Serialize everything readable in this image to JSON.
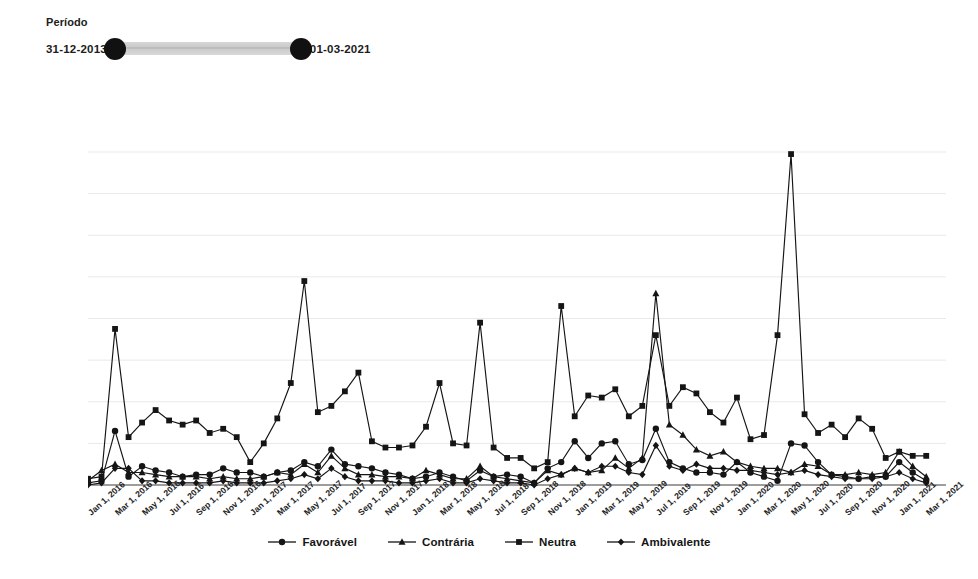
{
  "filter": {
    "title": "Período",
    "start_date": "31-12-2013",
    "end_date": "01-03-2021"
  },
  "legend": {
    "position": "bottom-center",
    "items": [
      {
        "label": "Favorável",
        "marker": "circle"
      },
      {
        "label": "Contrária",
        "marker": "triangle"
      },
      {
        "label": "Neutra",
        "marker": "square"
      },
      {
        "label": "Ambivalente",
        "marker": "diamond"
      }
    ]
  },
  "colors": {
    "series": "#151515",
    "grid": "#e9e9e9",
    "axis": "#7d7d7d",
    "slider_track": "#d6d6d6",
    "slider_handle": "#111111",
    "text": "#1a1a1a"
  },
  "chart_data": {
    "type": "line",
    "title": "",
    "subtitle": "",
    "xlabel": "",
    "ylabel": "",
    "grid": true,
    "legend_position": "bottom",
    "ylim": [
      0,
      160
    ],
    "yticks": [
      0,
      20,
      40,
      60,
      80,
      100,
      120,
      140,
      160
    ],
    "x": [
      "Jan 1, 2016",
      "Feb 1, 2016",
      "Mar 1, 2016",
      "Apr 1, 2016",
      "May 1, 2016",
      "Jun 1, 2016",
      "Jul 1, 2016",
      "Aug 1, 2016",
      "Sep 1, 2016",
      "Oct 1, 2016",
      "Nov 1, 2016",
      "Dec 1, 2016",
      "Jan 1, 2017",
      "Feb 1, 2017",
      "Mar 1, 2017",
      "Apr 1, 2017",
      "May 1, 2017",
      "Jun 1, 2017",
      "Jul 1, 2017",
      "Aug 1, 2017",
      "Sep 1, 2017",
      "Oct 1, 2017",
      "Nov 1, 2017",
      "Dec 1, 2017",
      "Jan 1, 2018",
      "Feb 1, 2018",
      "Mar 1, 2018",
      "Apr 1, 2018",
      "May 1, 2018",
      "Jun 1, 2018",
      "Jul 1, 2018",
      "Aug 1, 2018",
      "Sep 1, 2018",
      "Oct 1, 2018",
      "Nov 1, 2018",
      "Dec 1, 2018",
      "Jan 1, 2019",
      "Feb 1, 2019",
      "Mar 1, 2019",
      "Apr 1, 2019",
      "May 1, 2019",
      "Jun 1, 2019",
      "Jul 1, 2019",
      "Aug 1, 2019",
      "Sep 1, 2019",
      "Oct 1, 2019",
      "Nov 1, 2019",
      "Dec 1, 2019",
      "Jan 1, 2020",
      "Feb 1, 2020",
      "Mar 1, 2020",
      "Apr 1, 2020",
      "May 1, 2020",
      "Jun 1, 2020",
      "Jul 1, 2020",
      "Aug 1, 2020",
      "Sep 1, 2020",
      "Oct 1, 2020",
      "Nov 1, 2020",
      "Dec 1, 2020",
      "Jan 1, 2021",
      "Feb 1, 2021",
      "Mar 1, 2021"
    ],
    "xticks": [
      "Jan 1, 2016",
      "Mar 1, 2016",
      "May 1, 2016",
      "Jul 1, 2016",
      "Sep 1, 2016",
      "Nov 1, 2016",
      "Jan 1, 2017",
      "Mar 1, 2017",
      "May 1, 2017",
      "Jul 1, 2017",
      "Sep 1, 2017",
      "Nov 1, 2017",
      "Jan 1, 2018",
      "Mar 1, 2018",
      "May 1, 2018",
      "Jul 1, 2018",
      "Sep 1, 2018",
      "Nov 1, 2018",
      "Jan 1, 2019",
      "Mar 1, 2019",
      "May 1, 2019",
      "Jul 1, 2019",
      "Sep 1, 2019",
      "Nov 1, 2019",
      "Jan 1, 2020",
      "Mar 1, 2020",
      "May 1, 2020",
      "Jul 1, 2020",
      "Sep 1, 2020",
      "Nov 1, 2020",
      "Jan 1, 2021",
      "Mar 1, 2021"
    ],
    "series": [
      {
        "name": "Favorável",
        "marker": "circle",
        "values": [
          1,
          2,
          26,
          4,
          9,
          7,
          6,
          4,
          5,
          5,
          8,
          6,
          6,
          4,
          6,
          7,
          11,
          9,
          17,
          10,
          9,
          8,
          6,
          5,
          3,
          4,
          6,
          4,
          2,
          7,
          4,
          5,
          4,
          1,
          8,
          11,
          21,
          13,
          20,
          21,
          10,
          12,
          27,
          11,
          8,
          6,
          6,
          5,
          11,
          6,
          4,
          2,
          20,
          19,
          11,
          5,
          4,
          3,
          4,
          4,
          11,
          6,
          2
        ]
      },
      {
        "name": "Contrária",
        "marker": "triangle",
        "values": [
          2,
          7,
          10,
          6,
          6,
          5,
          4,
          4,
          4,
          3,
          4,
          3,
          3,
          4,
          6,
          5,
          10,
          6,
          14,
          8,
          5,
          5,
          4,
          4,
          3,
          7,
          5,
          3,
          3,
          9,
          4,
          3,
          2,
          1,
          7,
          5,
          8,
          6,
          7,
          13,
          8,
          13,
          92,
          29,
          24,
          17,
          14,
          16,
          11,
          9,
          8,
          8,
          6,
          10,
          9,
          5,
          5,
          6,
          5,
          6,
          16,
          9,
          4
        ]
      },
      {
        "name": "Neutra",
        "marker": "square",
        "values": [
          3,
          4,
          75,
          23,
          30,
          36,
          31,
          29,
          31,
          25,
          27,
          23,
          11,
          20,
          32,
          49,
          98,
          35,
          38,
          45,
          54,
          21,
          18,
          18,
          19,
          28,
          49,
          20,
          19,
          78,
          18,
          13,
          13,
          8,
          11,
          86,
          33,
          43,
          42,
          46,
          33,
          38,
          72,
          38,
          47,
          44,
          35,
          30,
          42,
          22,
          24,
          72,
          159,
          34,
          25,
          29,
          23,
          32,
          27,
          13,
          16,
          14,
          14
        ]
      },
      {
        "name": "Ambivalente",
        "marker": "diamond",
        "values": [
          0,
          1,
          8,
          8,
          2,
          2,
          1,
          1,
          1,
          1,
          2,
          1,
          1,
          1,
          2,
          3,
          5,
          3,
          8,
          4,
          2,
          2,
          2,
          1,
          1,
          2,
          3,
          1,
          1,
          3,
          2,
          1,
          1,
          0,
          3,
          5,
          8,
          6,
          9,
          9,
          6,
          5,
          19,
          9,
          7,
          10,
          8,
          8,
          7,
          7,
          6,
          5,
          6,
          7,
          5,
          4,
          3,
          3,
          3,
          4,
          6,
          3,
          1
        ]
      }
    ]
  }
}
